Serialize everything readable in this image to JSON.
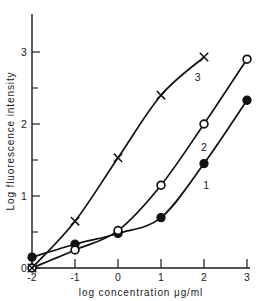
{
  "chart_data": {
    "type": "line",
    "title": "",
    "xlabel": "log  concentration  μg/ml",
    "ylabel": "Log  fluorescence  intensity",
    "xlim": [
      -2,
      3
    ],
    "ylim": [
      0,
      3.35
    ],
    "grid": false,
    "legend_position": "inline-curve-labels",
    "xticks": [
      -2,
      -1,
      0,
      1,
      2,
      3
    ],
    "xtick_labels": [
      "-2",
      "-1",
      "0",
      "1",
      "2",
      "3"
    ],
    "yticks": [
      0,
      1,
      2,
      3
    ],
    "ytick_labels": [
      "0",
      "1",
      "2",
      "3"
    ],
    "yticks_minor": [
      0.5,
      1.5,
      2.5
    ],
    "series": [
      {
        "name": "1",
        "label": "1",
        "marker": "filled-circle",
        "x": [
          -2,
          -1,
          0,
          1,
          2,
          3
        ],
        "values": [
          0.15,
          0.33,
          0.48,
          0.7,
          1.45,
          2.33
        ]
      },
      {
        "name": "2",
        "label": "2",
        "marker": "open-circle",
        "x": [
          -2,
          -1,
          0,
          1,
          2,
          3
        ],
        "values": [
          0.0,
          0.25,
          0.52,
          1.15,
          2.0,
          2.9
        ]
      },
      {
        "name": "3",
        "label": "3",
        "marker": "cross-x",
        "x": [
          -2,
          -1,
          0,
          1,
          2
        ],
        "values": [
          0.0,
          0.65,
          1.53,
          2.4,
          2.93
        ]
      }
    ],
    "curve_labels": [
      {
        "text": "3",
        "x": 1.85,
        "y": 2.6
      },
      {
        "text": "2",
        "x": 2.0,
        "y": 1.62
      },
      {
        "text": "1",
        "x": 2.05,
        "y": 1.1
      }
    ],
    "colors": {
      "line": "#111111",
      "axis": "#1a1a1a",
      "background": "#ffffff",
      "marker_fill": "#111111",
      "marker_open_fill": "#ffffff"
    }
  }
}
